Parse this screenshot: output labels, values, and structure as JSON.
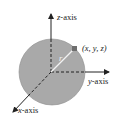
{
  "diagram": {
    "labels": {
      "z_axis_var": "z",
      "z_axis_suffix": "-axis",
      "y_axis_var": "y",
      "y_axis_suffix": "-axis",
      "x_axis_var": "x",
      "x_axis_suffix": "-axis",
      "point": "(x, y, z)",
      "radius": "r"
    },
    "colors": {
      "sphere_fill": "#a9a9a9",
      "sphere_stroke": "#8c8c8c",
      "axis": "#222222",
      "radius_line": "#f2f2f2",
      "point_marker": "#6e6e6e"
    }
  }
}
